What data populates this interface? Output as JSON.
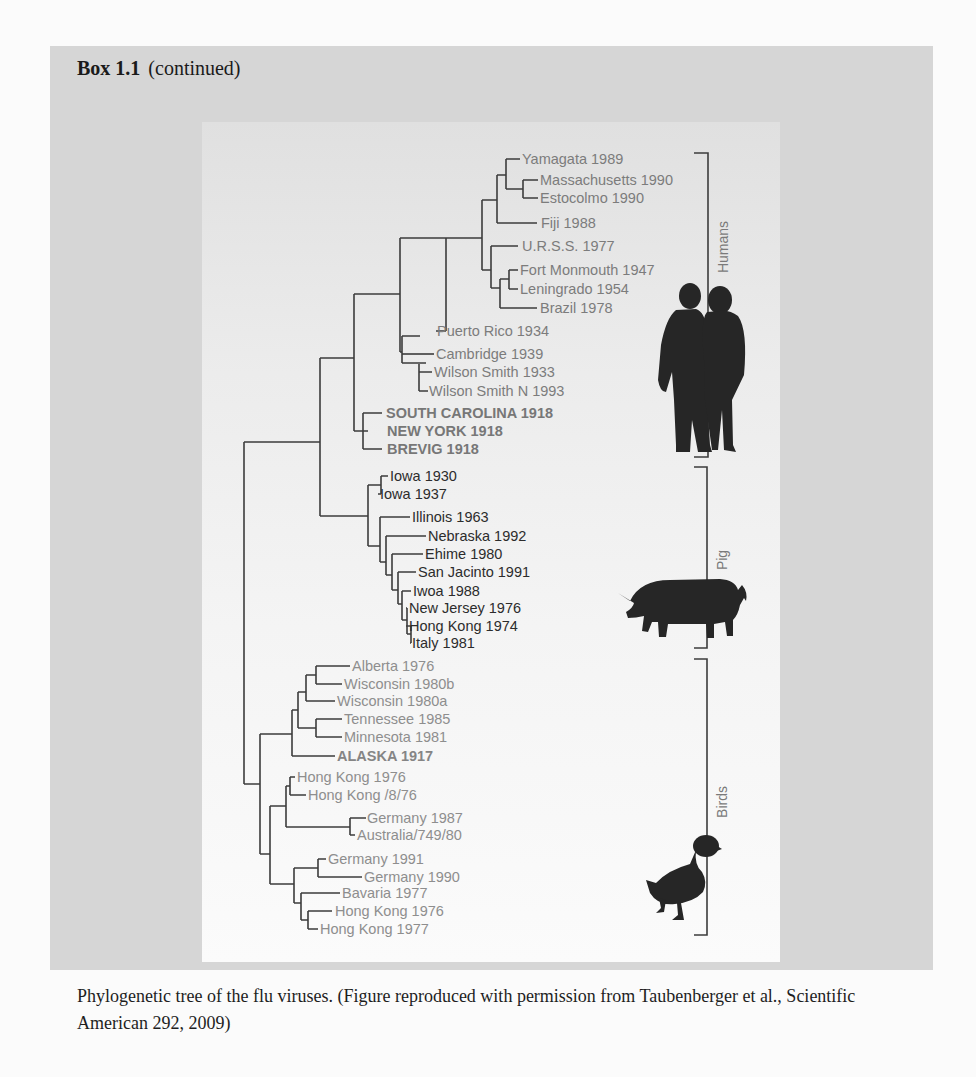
{
  "box": {
    "title_bold": "Box 1.1",
    "title_suffix": "(continued)",
    "caption": "Phylogenetic tree of the flu viruses. (Figure reproduced with permission from Taubenberger et al., Scientific American 292, 2009)"
  },
  "figure": {
    "groups": [
      {
        "name": "Humans",
        "icon": "human-couple-icon"
      },
      {
        "name": "Pig",
        "icon": "pig-icon"
      },
      {
        "name": "Birds",
        "icon": "duck-icon"
      }
    ],
    "humans": [
      "Yamagata 1989",
      "Massachusetts 1990",
      "Estocolmo 1990",
      "Fiji 1988",
      "U.R.S.S. 1977",
      "Fort Monmouth 1947",
      "Leningrado 1954",
      "Brazil 1978",
      "Puerto Rico 1934",
      "Cambridge 1939",
      "Wilson Smith 1933",
      "Wilson Smith N 1993",
      "SOUTH CAROLINA 1918",
      "NEW YORK 1918",
      "BREVIG 1918"
    ],
    "pig": [
      "Iowa 1930",
      "Iowa 1937",
      "Illinois 1963",
      "Nebraska 1992",
      "Ehime 1980",
      "San Jacinto 1991",
      "Iwoa 1988",
      "New Jersey 1976",
      "Hong Kong 1974",
      "Italy 1981"
    ],
    "birds": [
      "Alberta 1976",
      "Wisconsin 1980b",
      "Wisconsin 1980a",
      "Tennessee 1985",
      "Minnesota 1981",
      "ALASKA 1917",
      "Hong Kong 1976",
      "Hong Kong /8/76",
      "Germany 1987",
      "Australia/749/80",
      "Germany 1991",
      "Germany 1990",
      "Bavaria 1977",
      "Hong Kong 1976",
      "Hong Kong 1977"
    ]
  }
}
